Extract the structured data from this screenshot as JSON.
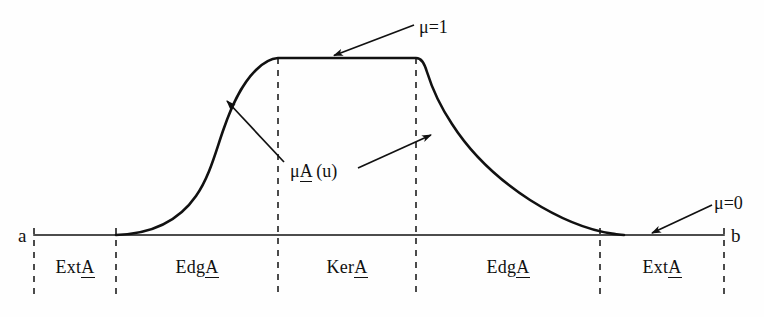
{
  "figure": {
    "background_color": "#fefefe",
    "line_color": "#111111"
  },
  "axis": {
    "left_endpoint_label": "a",
    "right_endpoint_label": "b",
    "baseline_y": 235,
    "baseline_x_start": 34,
    "baseline_x_end": 724
  },
  "annotations": {
    "mu_one": "μ=1",
    "mu_zero": "μ=0",
    "membership_function_prefix": "μ",
    "membership_function_set": "A",
    "membership_function_suffix": "  (u)"
  },
  "regions": [
    {
      "name": "region-ext-left",
      "prefix": "Ext",
      "set": "A",
      "center_x": 75,
      "x_start": 34,
      "x_end": 116
    },
    {
      "name": "region-edg-left",
      "prefix": "Edg",
      "set": "A",
      "center_x": 197,
      "x_start": 116,
      "x_end": 278
    },
    {
      "name": "region-ker",
      "prefix": "Ker",
      "set": "A",
      "center_x": 347,
      "x_start": 278,
      "x_end": 416
    },
    {
      "name": "region-edg-right",
      "prefix": "Edg",
      "set": "A",
      "center_x": 508,
      "x_start": 416,
      "x_end": 600
    },
    {
      "name": "region-ext-right",
      "prefix": "Ext",
      "set": "A",
      "center_x": 662,
      "x_start": 600,
      "x_end": 724
    }
  ],
  "chart_data": {
    "type": "line",
    "title": "",
    "xlabel": "",
    "ylabel": "",
    "xlim": [
      34,
      724
    ],
    "ylim": [
      0,
      1
    ],
    "grid": false,
    "legend": null,
    "series": [
      {
        "name": "membership-function",
        "description": "Trapezoid-like fuzzy membership curve rising from 0 at a, plateau at mu=1 over the kernel, falling back to 0 before b",
        "x": [
          34,
          116,
          140,
          165,
          185,
          200,
          212,
          222,
          232,
          245,
          262,
          278,
          416,
          424,
          432,
          445,
          465,
          495,
          530,
          565,
          595,
          615,
          724
        ],
        "y": [
          0.0,
          0.0,
          0.035,
          0.09,
          0.16,
          0.24,
          0.34,
          0.46,
          0.58,
          0.71,
          0.86,
          1.0,
          1.0,
          0.88,
          0.75,
          0.62,
          0.46,
          0.3,
          0.17,
          0.08,
          0.02,
          0.0,
          0.0
        ]
      }
    ],
    "dashed_verticals_x": [
      34,
      116,
      278,
      416,
      600,
      724
    ],
    "annotations": [
      {
        "text": "μ=1",
        "target_x": 332,
        "target_y": 0.985,
        "label_x": 420,
        "label_y": 1.22
      },
      {
        "text": "μ=0",
        "target_x": 655,
        "target_y": 0.0,
        "label_x": 718,
        "label_y": 0.19
      },
      {
        "text": "μA  (u)",
        "target_x_left": 226,
        "target_y_left": 0.76,
        "target_x_right": 432,
        "target_y_right": 0.57,
        "label_x": 292,
        "label_y": 0.41
      }
    ]
  }
}
